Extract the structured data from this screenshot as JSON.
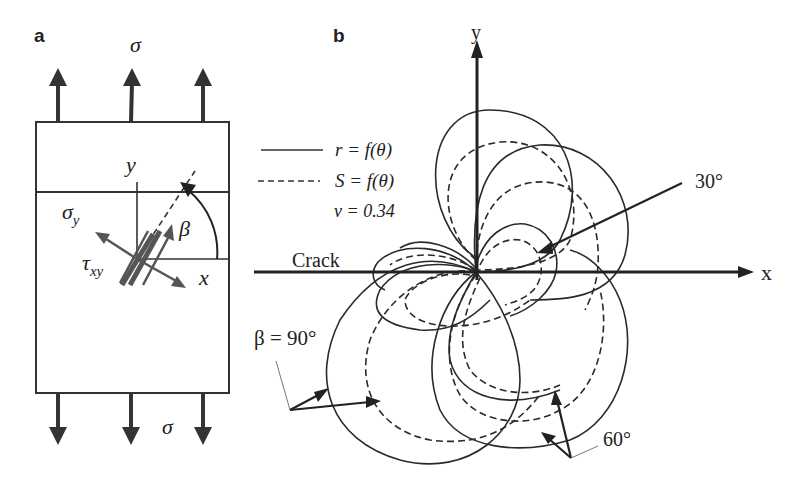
{
  "figure": {
    "panel_a": {
      "label": "a",
      "sigma_top": "σ",
      "sigma_bottom": "σ",
      "axis_y": "y",
      "axis_x": "x",
      "sigma_y": "σ",
      "sigma_y_sub": "y",
      "tau": "τ",
      "tau_sub": "xy",
      "beta": "β"
    },
    "panel_b": {
      "label": "b",
      "axis_y": "y",
      "axis_x": "x",
      "crack_label": "Crack",
      "legend": [
        {
          "style": "solid",
          "label": "r = f(θ)"
        },
        {
          "style": "dashed",
          "label": "S = f(θ)"
        }
      ],
      "poisson": "v = 0.34",
      "annotations": {
        "angle_30": "30°",
        "angle_60": "60°",
        "angle_90": "β = 90°"
      }
    },
    "colors": {
      "ink": "#2a2a2a",
      "arrow_gray": "#555555",
      "background": "#ffffff"
    }
  }
}
